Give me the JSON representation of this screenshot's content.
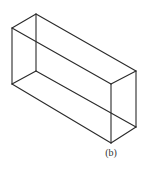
{
  "diagram": {
    "type": "wireframe-rectangular-prism",
    "caption": "(b)",
    "stroke_color": "#2a2a2a",
    "vertices": {
      "A": [
        36,
        14
      ],
      "B": [
        12,
        28
      ],
      "C": [
        12,
        84
      ],
      "D": [
        36,
        71
      ],
      "E": [
        136,
        71
      ],
      "F": [
        111,
        84
      ],
      "G": [
        111,
        143
      ],
      "H": [
        136,
        127
      ]
    },
    "edges": [
      [
        "A",
        "B"
      ],
      [
        "B",
        "C"
      ],
      [
        "A",
        "D"
      ],
      [
        "C",
        "D"
      ],
      [
        "A",
        "E"
      ],
      [
        "B",
        "F"
      ],
      [
        "E",
        "F"
      ],
      [
        "F",
        "G"
      ],
      [
        "E",
        "H"
      ],
      [
        "G",
        "H"
      ],
      [
        "C",
        "G"
      ],
      [
        "D",
        "H"
      ]
    ]
  }
}
